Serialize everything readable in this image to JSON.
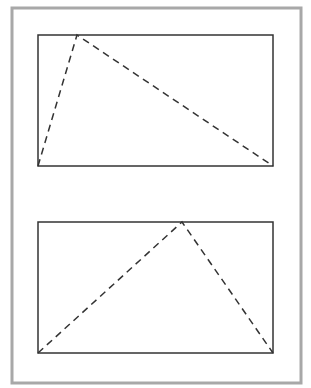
{
  "diagram": {
    "frame": {
      "x": 12,
      "y": 8,
      "width": 289,
      "height": 375,
      "color": "#a8a8a8"
    },
    "line_color": "#333333",
    "figures": [
      {
        "name": "top",
        "rect": {
          "x": 38,
          "y": 35,
          "width": 235,
          "height": 131
        },
        "triangle": {
          "points": [
            [
              38,
              166
            ],
            [
              77,
              35
            ],
            [
              273,
              166
            ]
          ]
        }
      },
      {
        "name": "bottom",
        "rect": {
          "x": 38,
          "y": 222,
          "width": 235,
          "height": 131
        },
        "triangle": {
          "points": [
            [
              38,
              353
            ],
            [
              182,
              222
            ],
            [
              273,
              353
            ]
          ]
        }
      }
    ]
  }
}
